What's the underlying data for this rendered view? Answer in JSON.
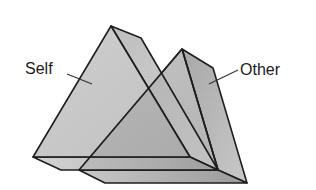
{
  "labels": {
    "self": "Self",
    "other": "Other"
  },
  "colors": {
    "background": "#ffffff",
    "edge": "#1e1e1e",
    "face_front": "#b2b2b2",
    "face_side": "#a4a4a4",
    "face_base_top": "#c6c6c6",
    "face_base_front": "#9c9c9c",
    "leader": "#333333"
  },
  "shapes": [
    {
      "name": "self",
      "description": "triangular prism (wedge)"
    },
    {
      "name": "other",
      "description": "triangular prism (wedge), offset behind/right, overlapping self"
    }
  ]
}
